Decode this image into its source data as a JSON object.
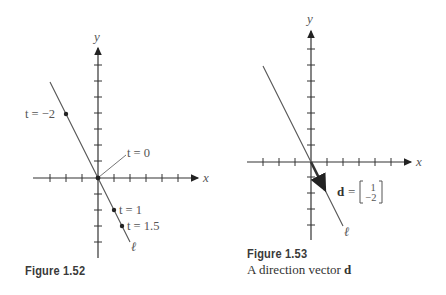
{
  "figures": [
    {
      "id": "fig152",
      "title": "Figure 1.52",
      "axes": {
        "x_label": "x",
        "y_label": "y"
      },
      "line_label": "ℓ",
      "points": [
        {
          "label": "t = −2",
          "t": -2,
          "x": -2,
          "y": 4
        },
        {
          "label": "t = 0",
          "t": 0,
          "x": 0,
          "y": 0
        },
        {
          "label": "t = 1",
          "t": 1,
          "x": 1,
          "y": -2
        },
        {
          "label": "t = 1.5",
          "t": 1.5,
          "x": 1.5,
          "y": -3
        }
      ]
    },
    {
      "id": "fig153",
      "title": "Figure 1.53",
      "caption_prefix": "A direction vector ",
      "caption_bold": "d",
      "axes": {
        "x_label": "x",
        "y_label": "y"
      },
      "line_label": "ℓ",
      "vector": {
        "name": "d",
        "equals": "=",
        "components": [
          "1",
          "−2"
        ]
      }
    }
  ],
  "colors": {
    "axis": "#333333",
    "line": "#555555",
    "text": "#555555"
  }
}
